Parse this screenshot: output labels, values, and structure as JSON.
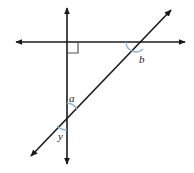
{
  "figure": {
    "type": "geometry-diagram",
    "width": 194,
    "height": 173,
    "background_color": "#ffffff",
    "line_color": "#1a1a1a",
    "arc_color": "#8ab4d0",
    "right_angle_marker_color": "#555555",
    "labels": {
      "a": "a",
      "b": "b",
      "y": "y"
    },
    "lines": [
      {
        "name": "vertical-line",
        "x1": 67,
        "y1": 6,
        "x2": 67,
        "y2": 166,
        "arrows": "both"
      },
      {
        "name": "horizontal-line",
        "x1": 14,
        "y1": 42,
        "x2": 187,
        "y2": 42,
        "arrows": "both"
      },
      {
        "name": "diagonal-line",
        "x1": 29,
        "y1": 158,
        "x2": 173,
        "y2": 8,
        "arrows": "both"
      }
    ],
    "intersections": [
      {
        "name": "vertical-horizontal",
        "x": 67,
        "y": 42,
        "marked": "right-angle"
      },
      {
        "name": "vertical-diagonal",
        "x": 67,
        "y": 116,
        "marked": "angles-a-y"
      },
      {
        "name": "horizontal-diagonal",
        "x": 136,
        "y": 42,
        "marked": "angle-b"
      }
    ],
    "angles": [
      {
        "name": "angle-a",
        "label": "a",
        "vertex_x": 67,
        "vertex_y": 116,
        "position": "above-right of vertical-diagonal intersection"
      },
      {
        "name": "angle-b",
        "label": "b",
        "vertex_x": 136,
        "vertex_y": 42,
        "position": "below-right of horizontal-diagonal intersection"
      },
      {
        "name": "angle-y",
        "label": "y",
        "vertex_x": 67,
        "vertex_y": 116,
        "position": "below-left of vertical-diagonal intersection"
      }
    ],
    "right_angle": {
      "name": "right-angle-marker",
      "vertex_x": 67,
      "vertex_y": 42,
      "size": 11,
      "quadrant": "lower-right"
    }
  }
}
